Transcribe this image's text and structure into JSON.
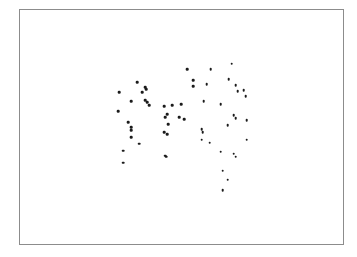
{
  "figure": {
    "kind": "scatter-plot-figure",
    "background_color": "#ffffff",
    "frame_color": "#8c8c8c",
    "frame_line_width_px": 1,
    "point_color": "#1b1b1b",
    "point_size_px": 2.6
  },
  "chart_data": {
    "type": "scatter",
    "title": "",
    "subtitle": "",
    "xlabel": "",
    "ylabel": "",
    "legend": [],
    "annotations": [],
    "grid": false,
    "axes_visible": false,
    "tick_labels_x": [],
    "tick_labels_y": [],
    "xlim": [
      0,
      325
    ],
    "ylim": [
      0,
      236
    ],
    "n_points": 57,
    "series": [
      {
        "name": "points",
        "color": "#1b1b1b",
        "marker": "circle",
        "points": [
          [
            168,
            176
          ],
          [
            192,
            176
          ],
          [
            213,
            182
          ],
          [
            174,
            165
          ],
          [
            174,
            159
          ],
          [
            188,
            161
          ],
          [
            210,
            166
          ],
          [
            217,
            160
          ],
          [
            219,
            154
          ],
          [
            227,
            149
          ],
          [
            225,
            155
          ],
          [
            118,
            163
          ],
          [
            126,
            158
          ],
          [
            127,
            156
          ],
          [
            100,
            153
          ],
          [
            123,
            153
          ],
          [
            126,
            145
          ],
          [
            128,
            143
          ],
          [
            130,
            140
          ],
          [
            112,
            144
          ],
          [
            145,
            139
          ],
          [
            153,
            140
          ],
          [
            162,
            141
          ],
          [
            185,
            144
          ],
          [
            202,
            141
          ],
          [
            215,
            130
          ],
          [
            217,
            127
          ],
          [
            228,
            125
          ],
          [
            148,
            131
          ],
          [
            160,
            128
          ],
          [
            165,
            126
          ],
          [
            99,
            134
          ],
          [
            145,
            113
          ],
          [
            149,
            121
          ],
          [
            183,
            116
          ],
          [
            184,
            113
          ],
          [
            109,
            123
          ],
          [
            112,
            118
          ],
          [
            112,
            115
          ],
          [
            112,
            108
          ],
          [
            120,
            101
          ],
          [
            104,
            94
          ],
          [
            146,
            128
          ],
          [
            148,
            111
          ],
          [
            147,
            88
          ],
          [
            104,
            82
          ],
          [
            146,
            89
          ],
          [
            209,
            120
          ],
          [
            183,
            105
          ],
          [
            191,
            102
          ],
          [
            202,
            93
          ],
          [
            215,
            91
          ],
          [
            217,
            88
          ],
          [
            228,
            105
          ],
          [
            209,
            65
          ],
          [
            204,
            74
          ],
          [
            204,
            54
          ]
        ]
      }
    ]
  }
}
